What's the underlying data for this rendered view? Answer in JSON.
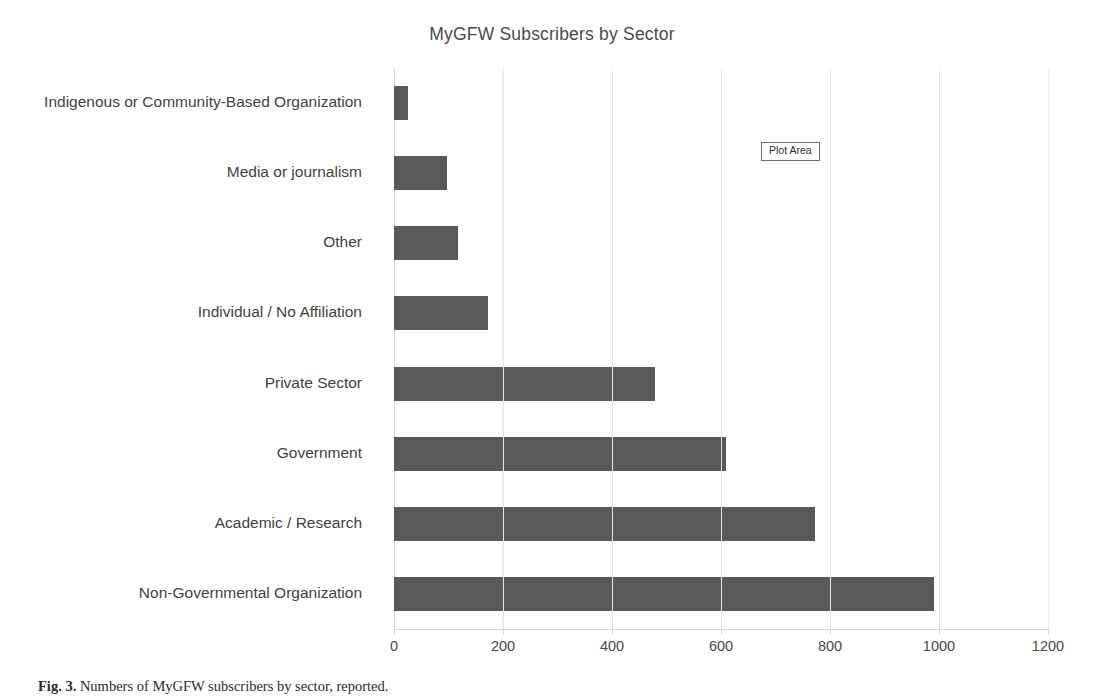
{
  "chart_data": {
    "type": "bar",
    "orientation": "horizontal",
    "title": "MyGFW Subscribers by Sector",
    "xlabel": "",
    "ylabel": "",
    "xlim": [
      0,
      1200
    ],
    "xticks": [
      0,
      200,
      400,
      600,
      800,
      1000,
      1200
    ],
    "xtick_labels": [
      "0",
      "200",
      "400",
      "600",
      "800",
      "1000",
      "1200"
    ],
    "grid": "vertical",
    "legend": "none",
    "bar_color": "#595959",
    "categories": [
      "Indigenous or Community-Based Organization",
      "Media or journalism",
      "Other",
      "Individual / No Affiliation",
      "Private Sector",
      "Government",
      "Academic / Research",
      "Non-Governmental Organization"
    ],
    "values": [
      25,
      98,
      118,
      172,
      478,
      610,
      772,
      990
    ]
  },
  "annotations": {
    "plot_area_tooltip": "Plot Area"
  },
  "caption": {
    "number": "Fig. 3.",
    "text": "Numbers of MyGFW subscribers by sector, reported."
  },
  "colors": {
    "bar": "#595959",
    "grid": "#e4e4e4",
    "axis": "#d9d9d9",
    "text": "#404040",
    "background": "#ffffff"
  }
}
